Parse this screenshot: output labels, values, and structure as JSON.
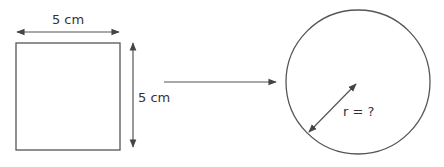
{
  "diagram": {
    "square": {
      "width_label": "5 cm",
      "height_label": "5 cm"
    },
    "circle": {
      "radius_label": "r = ?"
    },
    "colors": {
      "stroke": "#555555",
      "text": "#333333",
      "background": "#ffffff"
    }
  }
}
